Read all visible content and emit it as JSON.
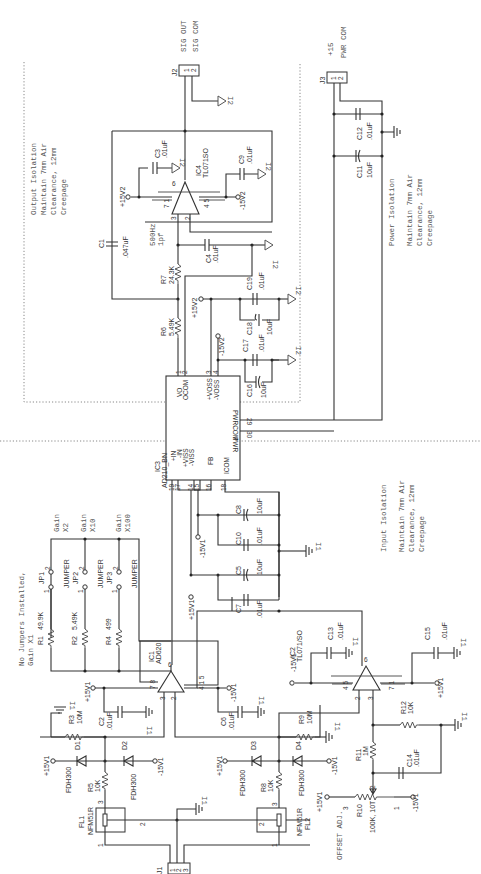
{
  "connectors": {
    "j1": {
      "ref": "J1",
      "pins": [
        "1",
        "2",
        "3"
      ]
    },
    "j2": {
      "ref": "J2",
      "pins": [
        "1",
        "2"
      ],
      "labels": [
        "SIG OUT",
        "SIG COM"
      ],
      "ground": "I2"
    },
    "j3": {
      "ref": "J3",
      "pins": [
        "1",
        "2"
      ],
      "labels": [
        "+15",
        "PWR COM"
      ]
    }
  },
  "isolation_notes": {
    "output": {
      "title": "Output Isolation",
      "lines": [
        "Maintain 7mm Air",
        "Clearance, 12mm",
        "Creepage"
      ]
    },
    "power": {
      "title": "Power Isolation",
      "lines": [
        "Maintain 7mm Air",
        "Clearance, 12mm",
        "Creepage"
      ]
    },
    "input": {
      "title": "Input Isolation",
      "lines": [
        "Maintain 7mm Air",
        "Clearance, 12mm",
        "Creepage"
      ]
    }
  },
  "gain_note": {
    "lines": [
      "No Jumpers Installed,",
      "Gain X1"
    ]
  },
  "gain_labels": [
    {
      "title": "Gain",
      "value": "X2"
    },
    {
      "title": "Gain",
      "value": "X10"
    },
    {
      "title": "Gain",
      "value": "X100"
    }
  ],
  "jumpers": [
    {
      "ref": "JP1",
      "type": "JUMPER",
      "pin1": "1",
      "pin2": "2"
    },
    {
      "ref": "JP2",
      "type": "JUMPER",
      "pin1": "1",
      "pin2": "2"
    },
    {
      "ref": "JP3",
      "type": "JUMPER",
      "pin1": "1",
      "pin2": "2"
    }
  ],
  "resistors": {
    "r1": {
      "ref": "R1",
      "value": "49.9K"
    },
    "r2": {
      "ref": "R2",
      "value": "5.49K"
    },
    "r4": {
      "ref": "R4",
      "value": "499"
    },
    "r3": {
      "ref": "R3",
      "value": "10M"
    },
    "r5": {
      "ref": "R5",
      "value": "10K"
    },
    "r6": {
      "ref": "R6",
      "value": "5.49K"
    },
    "r7": {
      "ref": "R7",
      "value": "24.3K"
    },
    "r8": {
      "ref": "R8",
      "value": "10K"
    },
    "r9": {
      "ref": "R9",
      "value": "10M"
    },
    "r10": {
      "ref": "R10",
      "value": "100K, 10T",
      "note": "OFFSET ADJ."
    },
    "r11": {
      "ref": "R11",
      "value": "1M"
    },
    "r12": {
      "ref": "R12",
      "value": "10K"
    }
  },
  "capacitors": {
    "c1": {
      "ref": "C1",
      "value": ".047uF"
    },
    "c2": {
      "ref": "C2",
      "value": ".01uF"
    },
    "c3": {
      "ref": "C3",
      "value": ".01uF"
    },
    "c4": {
      "ref": "C4",
      "value": ".01uF"
    },
    "c5": {
      "ref": "C5",
      "value": "10uF"
    },
    "c6": {
      "ref": "C6",
      "value": ".01uF"
    },
    "c7": {
      "ref": "C7",
      "value": ".01uF"
    },
    "c8": {
      "ref": "C8",
      "value": "10uF"
    },
    "c9": {
      "ref": "C9",
      "value": ".01uF"
    },
    "c10": {
      "ref": "C10",
      "value": ".01uF"
    },
    "c11": {
      "ref": "C11",
      "value": "10uF"
    },
    "c12": {
      "ref": "C12",
      "value": ".01uF"
    },
    "c13": {
      "ref": "C13",
      "value": ".01uF"
    },
    "c14": {
      "ref": "C14",
      "value": ".01uF"
    },
    "c15": {
      "ref": "C15",
      "value": ".01uF"
    },
    "c16": {
      "ref": "C16",
      "value": "10uF"
    },
    "c17": {
      "ref": "C17",
      "value": ".01uF"
    },
    "c18": {
      "ref": "C18",
      "value": "10uF"
    },
    "c19": {
      "ref": "C19",
      "value": ".01uF"
    }
  },
  "diodes": {
    "d1": {
      "ref": "D1",
      "part": "FDH300"
    },
    "d2": {
      "ref": "D2",
      "part": "FDH300"
    },
    "d3": {
      "ref": "D3",
      "part": "FDH300"
    },
    "d4": {
      "ref": "D4",
      "part": "FDH300"
    }
  },
  "filters": {
    "fl1": {
      "ref": "FL1",
      "part": "NFM51R",
      "pins": [
        "1",
        "2",
        "3"
      ]
    },
    "fl2": {
      "ref": "FL2",
      "part": "NFM51R",
      "pins": [
        "1",
        "2",
        "3"
      ]
    }
  },
  "ics": {
    "ic1": {
      "ref": "IC1",
      "part": "AD620",
      "pins": {
        "p2": "2",
        "p3": "3",
        "p6": "6",
        "p78": "7 8",
        "p415": "4 1 5"
      }
    },
    "ic2": {
      "ref": "IC2",
      "part": "TL071/SO",
      "pins": {
        "p2": "2",
        "p3": "3",
        "p6": "6",
        "p45": "4 5",
        "p71": "7 1"
      }
    },
    "ic4": {
      "ref": "IC4",
      "part": "TL071SO",
      "pins": {
        "p2": "2",
        "p3": "3",
        "p6": "6",
        "p71": "7 1",
        "p45": "4 5"
      }
    },
    "ic3": {
      "ref": "IC3",
      "part": "AD210_BN",
      "pins_out": [
        {
          "num": "1",
          "name": "VO"
        },
        {
          "num": "2",
          "name": "OCOM"
        },
        {
          "num": "3",
          "name": "+VOSS"
        },
        {
          "num": "4",
          "name": "-VOSS"
        }
      ],
      "pins_pwr": [
        {
          "num": "29",
          "name": "PWRCOM"
        },
        {
          "num": "30",
          "name": "PWR"
        }
      ],
      "pins_in": [
        {
          "num": "19",
          "name": "+IN"
        },
        {
          "num": "17",
          "name": "-IN"
        },
        {
          "num": "14",
          "name": "+VISS"
        },
        {
          "num": "15",
          "name": "-VISS"
        },
        {
          "num": "16",
          "name": "FB"
        },
        {
          "num": "18",
          "name": "ICOM"
        }
      ]
    }
  },
  "filter_note": {
    "lines": [
      "500Hz",
      "1pf"
    ]
  },
  "supplies": {
    "p15v1": "+15V1",
    "m15v1": "-15V1",
    "p15v2": "+15V2",
    "m15v2": "-15V2"
  },
  "grounds": {
    "i1": "I1",
    "i2": "I2"
  }
}
